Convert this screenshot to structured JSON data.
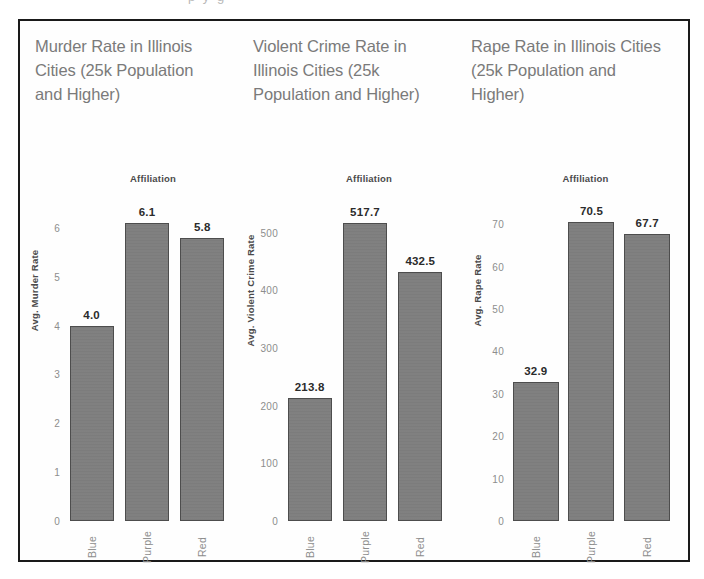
{
  "scan_artifact": {
    "ghost_text": "p  y        g"
  },
  "figure": {
    "frame_color": "#1a1a1a",
    "background": "#ffffff",
    "bar_fill": "#7e7e7e",
    "bar_outline": "#4d4d4d",
    "title_color": "#7a7a7a",
    "tick_color": "#8d8d8d"
  },
  "chart_data": [
    {
      "type": "bar",
      "title": "Murder Rate in Illinois Cities (25k Population and Higher)",
      "legend_caption": "Affiliation",
      "ylabel": "Avg. Murder Rate",
      "xlabel": "",
      "categories": [
        "Blue",
        "Purple",
        "Red"
      ],
      "values": [
        4.0,
        6.1,
        5.8
      ],
      "value_labels": [
        "4.0",
        "6.1",
        "5.8"
      ],
      "yticks": [
        0,
        1,
        2,
        3,
        4,
        5,
        6
      ],
      "ytick_labels": [
        "0",
        "1",
        "2",
        "3",
        "4",
        "5",
        "6"
      ],
      "ylim": [
        0,
        6.55
      ],
      "grid": false,
      "legend_position": "top"
    },
    {
      "type": "bar",
      "title": "Violent Crime Rate in Illinois Cities (25k Population and Higher)",
      "legend_caption": "Affiliation",
      "ylabel": "Avg. Violent Crime Rate",
      "xlabel": "",
      "categories": [
        "Blue",
        "Purple",
        "Red"
      ],
      "values": [
        213.8,
        517.7,
        432.5
      ],
      "value_labels": [
        "213.8",
        "517.7",
        "432.5"
      ],
      "yticks": [
        0,
        100,
        200,
        300,
        400,
        500
      ],
      "ytick_labels": [
        "0",
        "100",
        "200",
        "300",
        "400",
        "500"
      ],
      "ylim": [
        0,
        555
      ],
      "grid": false,
      "legend_position": "top"
    },
    {
      "type": "bar",
      "title": "Rape Rate in Illinois Cities (25k Population and Higher)",
      "legend_caption": "Affiliation",
      "ylabel": "Avg. Rape Rate",
      "xlabel": "",
      "categories": [
        "Blue",
        "Purple",
        "Red"
      ],
      "values": [
        32.9,
        70.5,
        67.7
      ],
      "value_labels": [
        "32.9",
        "70.5",
        "67.7"
      ],
      "yticks": [
        0,
        10,
        20,
        30,
        40,
        50,
        60,
        70
      ],
      "ytick_labels": [
        "0",
        "10",
        "20",
        "30",
        "40",
        "50",
        "60",
        "70"
      ],
      "ylim": [
        0,
        75.5
      ],
      "grid": false,
      "legend_position": "top"
    }
  ]
}
